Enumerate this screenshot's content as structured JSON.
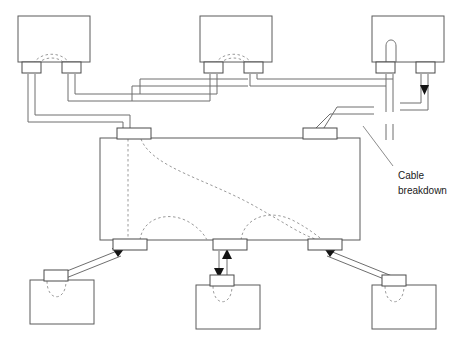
{
  "diagram": {
    "type": "network-topology-diagram",
    "colors": {
      "background": "#ffffff",
      "box_stroke": "#5b5b5b",
      "cable_stroke": "#6e6e6e",
      "internal_dashed": "#9a9a9a",
      "arrow_fill": "#141414",
      "text": "#1a1a1a"
    },
    "annotations": [
      {
        "id": "cable-breakdown",
        "line1": "Cable",
        "line2": "breakdown",
        "x": 398,
        "y": 176,
        "leader": {
          "x1": 393,
          "y1": 166,
          "x2": 363,
          "y2": 126
        }
      }
    ],
    "top_nodes": [
      {
        "id": "top-node-left",
        "x": 18,
        "y": 16,
        "w": 72,
        "h": 46,
        "ports": [
          {
            "x": 22,
            "y": 62,
            "w": 19,
            "h": 11
          },
          {
            "x": 62,
            "y": 62,
            "w": 19,
            "h": 11
          }
        ],
        "internal_arcs": [
          "M 31 73 C 31 48, 72 48, 72 73",
          "M 35 73 C 35 53, 68 53, 68 73"
        ]
      },
      {
        "id": "top-node-middle",
        "x": 200,
        "y": 16,
        "w": 72,
        "h": 46,
        "ports": [
          {
            "x": 204,
            "y": 62,
            "w": 19,
            "h": 11
          },
          {
            "x": 244,
            "y": 62,
            "w": 19,
            "h": 11
          }
        ],
        "internal_arcs": [
          "M 213 73 C 213 48, 254 48, 254 73",
          "M 217 73 C 217 53, 250 53, 250 73"
        ]
      },
      {
        "id": "top-node-right",
        "x": 372,
        "y": 16,
        "w": 72,
        "h": 46,
        "ports": [
          {
            "x": 376,
            "y": 62,
            "w": 19,
            "h": 11
          },
          {
            "x": 416,
            "y": 62,
            "w": 19,
            "h": 11
          }
        ],
        "internal_arcs": [
          "M 381 62 C 381 42, 393 42, 393 58"
        ]
      }
    ],
    "bottom_nodes": [
      {
        "id": "bottom-node-left",
        "x": 30,
        "y": 280,
        "w": 64,
        "h": 44,
        "ports": [
          {
            "x": 44,
            "y": 270,
            "w": 24,
            "h": 11
          }
        ],
        "internal_arcs": [
          "M 47 281 C 47 302, 66 302, 66 281"
        ]
      },
      {
        "id": "bottom-node-middle",
        "x": 196,
        "y": 285,
        "w": 64,
        "h": 44,
        "ports": [
          {
            "x": 210,
            "y": 275,
            "w": 24,
            "h": 11
          }
        ],
        "internal_arcs": [
          "M 213 286 C 213 307, 232 307, 232 286"
        ]
      },
      {
        "id": "bottom-node-right",
        "x": 372,
        "y": 285,
        "w": 64,
        "h": 44,
        "ports": [
          {
            "x": 382,
            "y": 275,
            "w": 24,
            "h": 11
          }
        ],
        "internal_arcs": [
          "M 385 286 C 385 307, 404 307, 404 286"
        ]
      }
    ],
    "central_node": {
      "id": "central-backplane",
      "x": 100,
      "y": 138,
      "w": 260,
      "h": 102,
      "top_ports": [
        {
          "x": 117,
          "y": 128,
          "w": 34,
          "h": 11
        },
        {
          "x": 303,
          "y": 128,
          "w": 34,
          "h": 11
        }
      ],
      "bottom_ports": [
        {
          "x": 113,
          "y": 239,
          "w": 34,
          "h": 11
        },
        {
          "x": 213,
          "y": 239,
          "w": 34,
          "h": 11
        },
        {
          "x": 308,
          "y": 239,
          "w": 34,
          "h": 11
        }
      ],
      "internal_paths": [
        "M 128 139 L 128 240",
        "M 141 139 C 152 168, 210 180, 258 208 C 290 226, 300 234, 318 240",
        "M 140 240 C 143 218, 168 212, 188 224 C 198 230, 203 236, 206 240",
        "M 240 240 C 243 218, 268 210, 292 222 C 306 229, 314 235, 322 240"
      ]
    }
  }
}
